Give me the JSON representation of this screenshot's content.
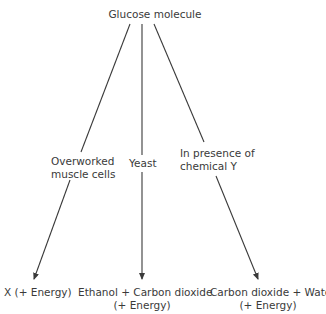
{
  "diagram": {
    "root": "Glucose molecule",
    "branches": [
      {
        "condition_line1": "Overworked",
        "condition_line2": "muscle cells",
        "product_line1": "X (+ Energy)",
        "product_line2": ""
      },
      {
        "condition_line1": "Yeast",
        "condition_line2": "",
        "product_line1": "Ethanol + Carbon dioxide",
        "product_line2": "(+ Energy)"
      },
      {
        "condition_line1": "In presence of",
        "condition_line2": "chemical Y",
        "product_line1": "Carbon dioxide + Water",
        "product_line2": "(+ Energy)"
      }
    ],
    "line_color": "#3a3a3a"
  }
}
